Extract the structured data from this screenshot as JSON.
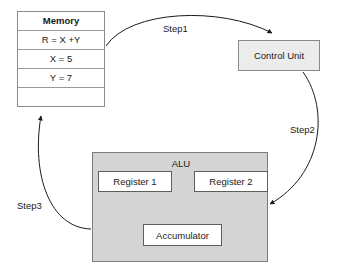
{
  "diagram": {
    "colors": {
      "background": "#ffffff",
      "alu_fill": "#d4d4d4",
      "control_unit_fill": "#ececec",
      "box_fill": "#ffffff",
      "stroke": "#1a1a1a",
      "box_border": "#8a8a8a"
    }
  },
  "memory": {
    "header": "Memory",
    "rows": [
      "R = X +Y",
      "X = 5",
      "Y = 7",
      ""
    ]
  },
  "control_unit": {
    "label": "Control Unit"
  },
  "alu": {
    "label": "ALU",
    "register_1": "Register 1",
    "register_2": "Register 2",
    "accumulator": "Accumulator"
  },
  "steps": [
    {
      "label": "Step1",
      "from": "Memory",
      "to": "Control Unit"
    },
    {
      "label": "Step2",
      "from": "Control Unit",
      "to": "ALU"
    },
    {
      "label": "Step3",
      "from": "ALU",
      "to": "Memory"
    }
  ]
}
